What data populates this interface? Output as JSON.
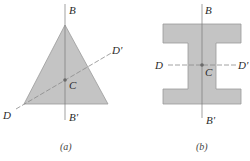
{
  "colors": {
    "shape_fill": "#c4c4c4",
    "shape_stroke": "#9a9a9a",
    "axis_line": "#7a7a7a",
    "centroid": "#6a6a6a",
    "text": "#2a2a2a"
  },
  "figure_a": {
    "caption": "(a)",
    "shape": "triangle",
    "labels": {
      "B": "B",
      "B_prime": "B'",
      "D": "D",
      "D_prime": "D'",
      "C": "C"
    }
  },
  "figure_b": {
    "caption": "(b)",
    "shape": "I-section",
    "labels": {
      "B": "B",
      "B_prime": "B'",
      "D": "D",
      "D_prime": "D'",
      "C": "C"
    }
  }
}
